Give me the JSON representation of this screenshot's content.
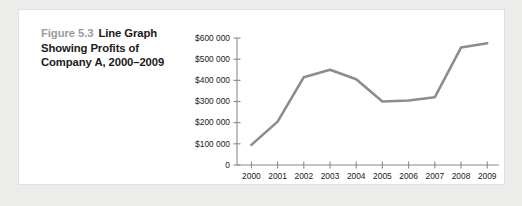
{
  "figure": {
    "number_label": "Figure 5.3",
    "title_text": "Line Graph Showing Profits of Company A, 2000–2009",
    "number_color": "#9b9b9b",
    "title_color": "#1a1a1a"
  },
  "chart_data": {
    "type": "line",
    "title": "",
    "xlabel": "",
    "ylabel": "",
    "categories": [
      "2000",
      "2001",
      "2002",
      "2003",
      "2004",
      "2005",
      "2006",
      "2007",
      "2008",
      "2009"
    ],
    "values": [
      95000,
      205000,
      415000,
      450000,
      405000,
      300000,
      305000,
      320000,
      555000,
      575000
    ],
    "series": [
      {
        "name": "Profits",
        "values": [
          95000,
          205000,
          415000,
          450000,
          405000,
          300000,
          305000,
          320000,
          555000,
          575000
        ],
        "color": "#8c8c8c"
      }
    ],
    "ylim": [
      0,
      600000
    ],
    "ytick_values": [
      0,
      100000,
      200000,
      300000,
      400000,
      500000,
      600000
    ],
    "ytick_labels": [
      "0",
      "$100 000",
      "$200 000",
      "$300 000",
      "$400 000",
      "$500 000",
      "$600 000"
    ],
    "xtick_labels": [
      "2000",
      "2001",
      "2002",
      "2003",
      "2004",
      "2005",
      "2006",
      "2007",
      "2008",
      "2009"
    ],
    "grid": false,
    "legend": false,
    "legend_position": "none",
    "axis_color": "#8a8a8a",
    "line_color": "#8c8c8c"
  }
}
